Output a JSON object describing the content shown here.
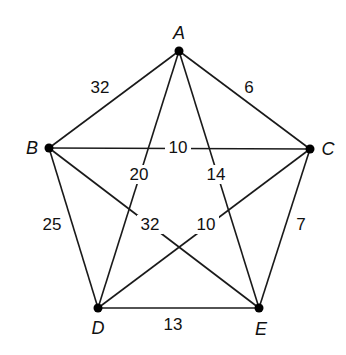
{
  "graph": {
    "type": "weighted-undirected-complete-graph",
    "nodes": [
      {
        "id": "A",
        "label": "A",
        "x": 179,
        "y": 51,
        "label_x": 179,
        "label_y": 39
      },
      {
        "id": "B",
        "label": "B",
        "x": 49,
        "y": 148,
        "label_x": 32,
        "label_y": 154
      },
      {
        "id": "C",
        "label": "C",
        "x": 310,
        "y": 149,
        "label_x": 328,
        "label_y": 155
      },
      {
        "id": "D",
        "label": "D",
        "x": 98,
        "y": 308,
        "label_x": 98,
        "label_y": 334
      },
      {
        "id": "E",
        "label": "E",
        "x": 259,
        "y": 308,
        "label_x": 261,
        "label_y": 335
      }
    ],
    "edges": [
      {
        "from": "A",
        "to": "B",
        "weight": "32",
        "label_x": 100,
        "label_y": 93,
        "mask": false
      },
      {
        "from": "A",
        "to": "C",
        "weight": "6",
        "label_x": 249,
        "label_y": 93,
        "mask": false
      },
      {
        "from": "B",
        "to": "C",
        "weight": "10",
        "label_x": 178,
        "label_y": 153,
        "mask": true
      },
      {
        "from": "A",
        "to": "D",
        "weight": "20",
        "label_x": 139,
        "label_y": 180,
        "mask": true
      },
      {
        "from": "A",
        "to": "E",
        "weight": "14",
        "label_x": 216,
        "label_y": 180,
        "mask": true
      },
      {
        "from": "B",
        "to": "E",
        "weight": "32",
        "label_x": 150,
        "label_y": 230,
        "mask": true
      },
      {
        "from": "C",
        "to": "D",
        "weight": "10",
        "label_x": 206,
        "label_y": 230,
        "mask": true
      },
      {
        "from": "B",
        "to": "D",
        "weight": "25",
        "label_x": 52,
        "label_y": 230,
        "mask": false
      },
      {
        "from": "C",
        "to": "E",
        "weight": "7",
        "label_x": 301,
        "label_y": 230,
        "mask": false
      },
      {
        "from": "D",
        "to": "E",
        "weight": "13",
        "label_x": 173,
        "label_y": 330,
        "mask": false
      }
    ]
  },
  "colors": {
    "edge": "#1a1a1a",
    "node": "#000000",
    "text": "#111111",
    "background": "#ffffff"
  }
}
